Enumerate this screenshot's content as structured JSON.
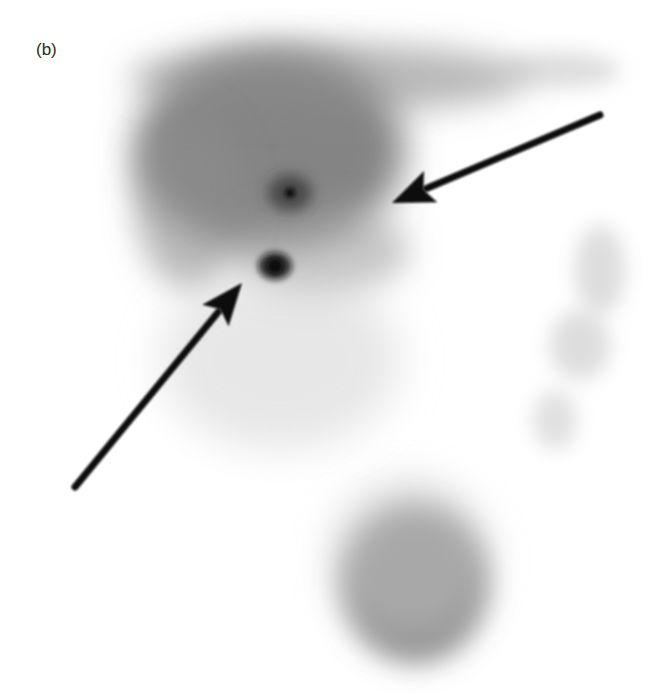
{
  "figure": {
    "panel_label": "(b)",
    "background": "#ffffff",
    "regions": [
      {
        "name": "liver-uptake",
        "cx": 270,
        "cy": 150,
        "rx": 135,
        "ry": 100,
        "color": "#6e6e6e",
        "opacity": 0.85,
        "blur": 18
      },
      {
        "name": "liver-upper-band",
        "cx": 330,
        "cy": 78,
        "rx": 200,
        "ry": 35,
        "color": "#8a8a8a",
        "opacity": 0.6,
        "blur": 16
      },
      {
        "name": "liver-right-lobe-faint",
        "cx": 560,
        "cy": 70,
        "rx": 60,
        "ry": 18,
        "color": "#bcbcbc",
        "opacity": 0.5,
        "blur": 10
      },
      {
        "name": "liver-lower-edge",
        "cx": 320,
        "cy": 250,
        "rx": 90,
        "ry": 45,
        "color": "#9a9a9a",
        "opacity": 0.55,
        "blur": 16
      },
      {
        "name": "liver-left-edge",
        "cx": 190,
        "cy": 200,
        "rx": 55,
        "ry": 90,
        "color": "#8e8e8e",
        "opacity": 0.6,
        "blur": 16
      },
      {
        "name": "bowel-faint-trail",
        "cx": 280,
        "cy": 360,
        "rx": 120,
        "ry": 90,
        "color": "#d0d0d0",
        "opacity": 0.5,
        "blur": 20
      },
      {
        "name": "right-colon-faint-upper",
        "cx": 600,
        "cy": 270,
        "rx": 25,
        "ry": 45,
        "color": "#cfcfcf",
        "opacity": 0.7,
        "blur": 10
      },
      {
        "name": "right-colon-faint-mid",
        "cx": 580,
        "cy": 345,
        "rx": 30,
        "ry": 35,
        "color": "#cfcfcf",
        "opacity": 0.7,
        "blur": 10
      },
      {
        "name": "right-colon-faint-lower",
        "cx": 555,
        "cy": 420,
        "rx": 22,
        "ry": 30,
        "color": "#d3d3d3",
        "opacity": 0.7,
        "blur": 10
      },
      {
        "name": "bladder-uptake",
        "cx": 415,
        "cy": 585,
        "rx": 72,
        "ry": 78,
        "color": "#7a7a7a",
        "opacity": 0.85,
        "blur": 14
      },
      {
        "name": "bladder-halo",
        "cx": 410,
        "cy": 560,
        "rx": 80,
        "ry": 80,
        "color": "#bdbdbd",
        "opacity": 0.55,
        "blur": 18
      }
    ],
    "hot_spots": [
      {
        "name": "focal-uptake-upper",
        "cx": 290,
        "cy": 193,
        "rx": 22,
        "ry": 18,
        "color": "#3a3a3a",
        "blur": 7,
        "core_r": 5
      },
      {
        "name": "focal-uptake-lower",
        "cx": 275,
        "cy": 266,
        "rx": 17,
        "ry": 14,
        "color": "#111111",
        "blur": 3,
        "core_r": 8
      }
    ],
    "arrows": [
      {
        "name": "upper-arrow",
        "x1": 600,
        "y1": 115,
        "x2": 392,
        "y2": 203,
        "color": "#0a0a0a",
        "width": 7
      },
      {
        "name": "lower-arrow",
        "x1": 75,
        "y1": 487,
        "x2": 242,
        "y2": 283,
        "color": "#0a0a0a",
        "width": 7
      }
    ]
  }
}
